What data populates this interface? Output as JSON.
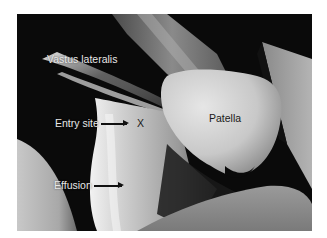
{
  "figure": {
    "labels": {
      "vastus_lateralis": "Vastus lateralis",
      "entry_site": "Entry site",
      "entry_marker": "X",
      "patella": "Patella",
      "effusion": "Effusion"
    },
    "colors": {
      "background": "#0a0a0a",
      "tissue_light": "#d8d8d8",
      "tissue_mid": "#9a9a9a",
      "tissue_dark": "#3a3a3a",
      "label_light": "#e8e8e8",
      "label_dark": "#1a1a1a"
    }
  }
}
